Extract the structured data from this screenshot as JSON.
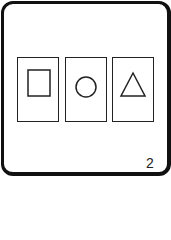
{
  "card": {
    "shapes": [
      {
        "icon": "square-icon"
      },
      {
        "icon": "circle-icon"
      },
      {
        "icon": "triangle-icon"
      }
    ],
    "page_number": "2"
  },
  "colors": {
    "stroke": "#222222",
    "background": "#ffffff"
  }
}
